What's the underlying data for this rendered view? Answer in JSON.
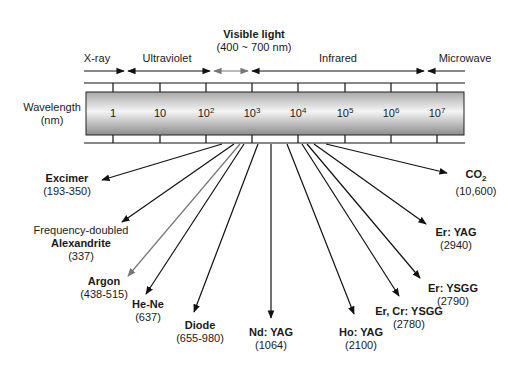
{
  "figure": {
    "visible_light": {
      "title": "Visible light",
      "range": "(400 ~ 700 nm)"
    },
    "bands": [
      {
        "label": "X-ray",
        "x": 83
      },
      {
        "label": "Ultraviolet",
        "x": 167
      },
      {
        "label": "Infrared",
        "x": 338
      },
      {
        "label": "Microwave",
        "x": 465
      }
    ],
    "axis": {
      "title_line1": "Wavelength",
      "title_line2": "(nm)",
      "ticks": [
        {
          "base": "1",
          "exp": ""
        },
        {
          "base": "10",
          "exp": ""
        },
        {
          "base": "10",
          "exp": "2"
        },
        {
          "base": "10",
          "exp": "3"
        },
        {
          "base": "10",
          "exp": "4"
        },
        {
          "base": "10",
          "exp": "5"
        },
        {
          "base": "10",
          "exp": "6"
        },
        {
          "base": "10",
          "exp": "7"
        }
      ]
    },
    "lasers": [
      {
        "name": "Excimer",
        "prefix": "",
        "wavelength": "(193-350)"
      },
      {
        "name": "Alexandrite",
        "prefix": "Frequency-doubled",
        "wavelength": "(337)"
      },
      {
        "name": "Argon",
        "prefix": "",
        "wavelength": "(438-515)"
      },
      {
        "name": "He-Ne",
        "prefix": "",
        "wavelength": "(637)"
      },
      {
        "name": "Diode",
        "prefix": "",
        "wavelength": "(655-980)"
      },
      {
        "name": "Nd: YAG",
        "prefix": "",
        "wavelength": "(1064)"
      },
      {
        "name": "Ho: YAG",
        "prefix": "",
        "wavelength": "(2100)"
      },
      {
        "name": "Er, Cr: YSGG",
        "prefix": "",
        "wavelength": "(2780)"
      },
      {
        "name": "Er: YSGG",
        "prefix": "",
        "wavelength": "(2790)"
      },
      {
        "name": "Er: YAG",
        "prefix": "",
        "wavelength": "(2940)"
      },
      {
        "name": "CO",
        "subscript": "2",
        "prefix": "",
        "wavelength": "(10,600)"
      }
    ],
    "colors": {
      "line": "#111111",
      "visible_arrow": "#777777",
      "bar_dark": "#8c8c8c",
      "bar_light": "#f4f4f4"
    }
  }
}
